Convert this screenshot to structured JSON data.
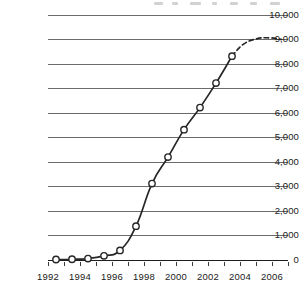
{
  "chart_data": {
    "type": "line",
    "title": "",
    "xlabel": "",
    "ylabel": "",
    "xlim": [
      1992,
      2007
    ],
    "ylim": [
      0,
      10000
    ],
    "grid": true,
    "legend": null,
    "y_ticks": [
      0,
      1000,
      2000,
      3000,
      4000,
      5000,
      6000,
      7000,
      8000,
      9000,
      10000
    ],
    "y_tick_labels": [
      "0",
      "1,000",
      "2,000",
      "3,000",
      "4,000",
      "5,000",
      "6,000",
      "7,000",
      "8,000",
      "9,000",
      "10,000"
    ],
    "x_ticks": [
      1992,
      1993,
      1994,
      1995,
      1996,
      1997,
      1998,
      1999,
      2000,
      2001,
      2002,
      2003,
      2004,
      2005,
      2006,
      2007
    ],
    "x_tick_labels": [
      "1992",
      "",
      "1994",
      "",
      "1996",
      "",
      "1998",
      "",
      "2000",
      "",
      "2002",
      "",
      "2004",
      "",
      "2006",
      ""
    ],
    "x_labels_shown": [
      "1992",
      "1994",
      "1996",
      "1998",
      "2000",
      "2002",
      "2004",
      "2006"
    ],
    "marker": "open-circle",
    "series": [
      {
        "name": "observed",
        "style": "solid",
        "x": [
          1992.5,
          1993.5,
          1994.5,
          1995.5,
          1996.5,
          1997.5,
          1998.5,
          1999.5,
          2000.5,
          2001.5,
          2002.5,
          2003.5
        ],
        "values": [
          20,
          30,
          60,
          170,
          390,
          1380,
          3120,
          4200,
          5320,
          6220,
          7220,
          8320
        ]
      },
      {
        "name": "projected",
        "style": "dashed",
        "x": [
          2003.5,
          2004.2,
          2005.0,
          2005.8,
          2006.6
        ],
        "values": [
          8320,
          8800,
          9020,
          9070,
          9000
        ]
      }
    ]
  },
  "axis": {
    "y_axis_name": "y-axis",
    "x_axis_name": "x-axis"
  },
  "colors": {
    "line": "#262626",
    "grid": "#6b6b6b",
    "marker_fill": "#ffffff",
    "background": "#ffffff"
  }
}
